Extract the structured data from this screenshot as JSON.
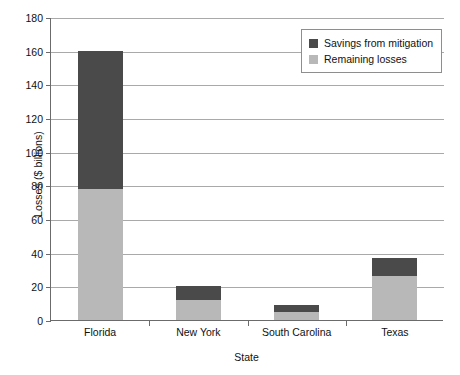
{
  "chart_data": {
    "type": "bar",
    "subtype": "stacked-vertical",
    "title": "",
    "xlabel": "State",
    "ylabel": "Losses ($ billions)",
    "categories": [
      "Florida",
      "New York",
      "South Carolina",
      "Texas"
    ],
    "series": [
      {
        "name": "Remaining losses",
        "values": [
          78,
          12,
          5,
          26
        ],
        "color": "#b8b8b8"
      },
      {
        "name": "Savings from mitigation",
        "values": [
          82,
          8,
          4,
          11
        ],
        "color": "#4a4a4a"
      }
    ],
    "totals": [
      160,
      20,
      9,
      37
    ],
    "ylim": [
      0,
      180
    ],
    "ytick_step": 20,
    "yticks": [
      0,
      20,
      40,
      60,
      80,
      100,
      120,
      140,
      160,
      180
    ],
    "ytick_labels": [
      "0",
      "20",
      "40",
      "60",
      "80",
      "100",
      "120",
      "140",
      "160",
      "180"
    ],
    "grid": "horizontal",
    "legend_position": "top-right",
    "legend_entries": [
      "Savings from mitigation",
      "Remaining losses"
    ]
  },
  "legend": {
    "items": [
      {
        "label": "Savings from mitigation",
        "color": "#4a4a4a"
      },
      {
        "label": "Remaining losses",
        "color": "#b8b8b8"
      }
    ]
  },
  "colors": {
    "savings": "#4a4a4a",
    "remaining": "#b8b8b8",
    "grid": "#a9a9a9",
    "axis": "#6b6b6b",
    "text": "#111111",
    "background": "#ffffff"
  }
}
